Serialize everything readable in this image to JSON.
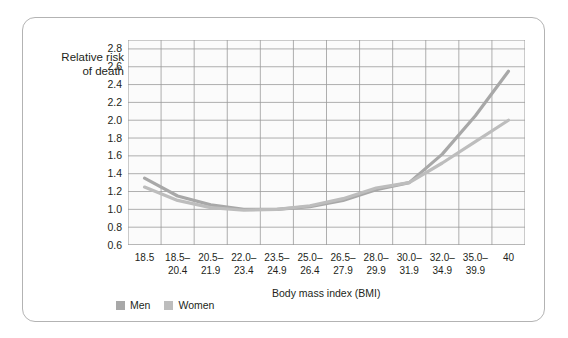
{
  "chart_data": {
    "type": "line",
    "title": "",
    "xlabel": "Body mass index (BMI)",
    "ylabel": "Relative risk\nof death",
    "ylabel_line1": "Relative risk",
    "ylabel_line2": "of death",
    "categories": [
      "18.5",
      "18.5–20.4",
      "20.5–21.9",
      "22.0–23.4",
      "23.5–24.9",
      "25.0–26.4",
      "26.5–27.9",
      "28.0–29.9",
      "30.0–31.9",
      "32.0–34.9",
      "35.0–39.9",
      "40"
    ],
    "category_lines": [
      [
        "18.5",
        ""
      ],
      [
        "18.5–",
        "20.4"
      ],
      [
        "20.5–",
        "21.9"
      ],
      [
        "22.0–",
        "23.4"
      ],
      [
        "23.5–",
        "24.9"
      ],
      [
        "25.0–",
        "26.4"
      ],
      [
        "26.5–",
        "27.9"
      ],
      [
        "28.0–",
        "29.9"
      ],
      [
        "30.0–",
        "31.9"
      ],
      [
        "32.0–",
        "34.9"
      ],
      [
        "35.0–",
        "39.9"
      ],
      [
        "40",
        ""
      ]
    ],
    "ylim": [
      0.6,
      2.9
    ],
    "yticks": [
      "0.6",
      "0.8",
      "1.0",
      "1.2",
      "1.4",
      "1.6",
      "1.8",
      "2.0",
      "2.2",
      "2.4",
      "2.6",
      "2.8"
    ],
    "ytick_values": [
      0.6,
      0.8,
      1.0,
      1.2,
      1.4,
      1.6,
      1.8,
      2.0,
      2.2,
      2.4,
      2.6,
      2.8
    ],
    "grid": true,
    "legend_position": "bottom-left",
    "series": [
      {
        "name": "Men",
        "color": "#a8a8a8",
        "values": [
          1.35,
          1.15,
          1.05,
          1.0,
          1.0,
          1.03,
          1.1,
          1.22,
          1.3,
          1.62,
          2.05,
          2.55
        ]
      },
      {
        "name": "Women",
        "color": "#bdbdbd",
        "values": [
          1.25,
          1.1,
          1.02,
          0.99,
          1.0,
          1.04,
          1.12,
          1.24,
          1.3,
          1.52,
          1.76,
          2.0
        ]
      }
    ]
  },
  "axis": {
    "ylabel_line1": "Relative risk",
    "ylabel_line2": "of death",
    "xlabel": "Body mass index (BMI)"
  },
  "legend": {
    "items": [
      {
        "label": "Men",
        "color": "#a8a8a8"
      },
      {
        "label": "Women",
        "color": "#bdbdbd"
      }
    ]
  },
  "colors": {
    "card_border": "#b3b3b3",
    "grid": "#9a9a9a",
    "plot_bg": "#fbfbfb",
    "text": "#231f20",
    "men_line": "#a8a8a8",
    "women_line": "#bdbdbd"
  }
}
